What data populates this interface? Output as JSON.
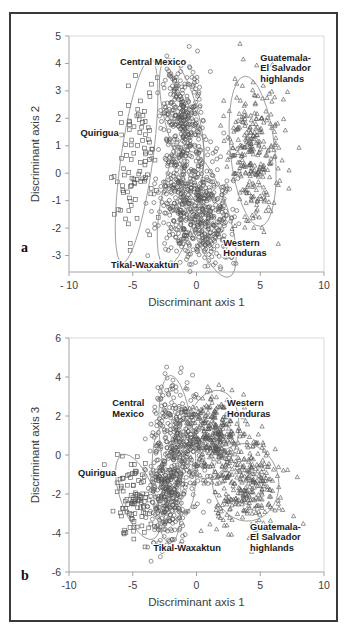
{
  "figure": {
    "panels": [
      {
        "id": "a",
        "letter": "a",
        "xlabel": "Discriminant axis 1",
        "ylabel": "Discriminant axis 2",
        "xticks": [
          "- 10",
          "-5",
          "0",
          "5",
          "10"
        ],
        "xtickvalues": [
          -10,
          -5,
          0,
          5,
          10
        ],
        "yticks": [
          "5",
          "4",
          "3",
          "2",
          "1",
          "0",
          "-1",
          "-2",
          "-3"
        ],
        "ytickvalues": [
          5,
          4,
          3,
          2,
          1,
          0,
          -1,
          -2,
          -3
        ],
        "xlim": [
          -10,
          10
        ],
        "ylim": [
          -3.6,
          5
        ],
        "grid": false,
        "labels": [
          {
            "name": "central-mexico",
            "text": "Central Mexico",
            "lines": [
              "Central Mexico"
            ],
            "x": -6.0,
            "y": 3.95
          },
          {
            "name": "guatemala-el-salvador-highlands",
            "text": "Guatemala-El Salvador highlands",
            "lines": [
              "Guatemala-",
              "El Salvador",
              "highlands"
            ],
            "x": 5.0,
            "y": 4.1
          },
          {
            "name": "quirigua",
            "text": "Quirigua",
            "lines": [
              "Quirigua"
            ],
            "x": -9.1,
            "y": 1.35
          },
          {
            "name": "western-honduras",
            "text": "Western Honduras",
            "lines": [
              "Western",
              "Honduras"
            ],
            "x": 2.1,
            "y": -2.65
          },
          {
            "name": "tikal-waxaktun",
            "text": "Tikal-Waxaktun",
            "lines": [
              "Tikal-Waxaktun"
            ],
            "x": -6.7,
            "y": -3.45
          }
        ]
      },
      {
        "id": "b",
        "letter": "b",
        "xlabel": "Discriminant axis 1",
        "ylabel": "Discriminant axis 3",
        "xticks": [
          "-10",
          "-5",
          "0",
          "5",
          "10"
        ],
        "xtickvalues": [
          -10,
          -5,
          0,
          5,
          10
        ],
        "yticks": [
          "6",
          "4",
          "2",
          "0",
          "-2",
          "-4",
          "-6"
        ],
        "ytickvalues": [
          6,
          4,
          2,
          0,
          -2,
          -4,
          -6
        ],
        "xlim": [
          -10,
          10
        ],
        "ylim": [
          -6,
          6
        ],
        "grid": false,
        "labels": [
          {
            "name": "central-mexico",
            "text": "Central Mexico",
            "lines": [
              "Central",
              "Mexico"
            ],
            "x": -6.6,
            "y": 2.5
          },
          {
            "name": "western-honduras",
            "text": "Western Honduras",
            "lines": [
              "Western",
              "Honduras"
            ],
            "x": 2.4,
            "y": 2.5
          },
          {
            "name": "quirigua",
            "text": "Quirigua",
            "lines": [
              "Quirigua"
            ],
            "x": -9.3,
            "y": -1.1
          },
          {
            "name": "tikal-waxaktun",
            "text": "Tikal-Waxaktun",
            "lines": [
              "Tikal-Waxaktun"
            ],
            "x": -3.4,
            "y": -4.9
          },
          {
            "name": "guatemala-el-salvador-highlands",
            "text": "Guatemala-El Salvador highlands",
            "lines": [
              "Guatemala-",
              "El Salvador",
              "highlands"
            ],
            "x": 4.2,
            "y": -3.85
          }
        ]
      }
    ]
  },
  "chart_data": [
    {
      "type": "scatter",
      "panel": "a",
      "title": "",
      "xlabel": "Discriminant axis 1",
      "ylabel": "Discriminant axis 2",
      "xlim": [
        -10,
        10
      ],
      "ylim": [
        -3.6,
        5
      ],
      "xticks": [
        -10,
        -5,
        0,
        5,
        10
      ],
      "yticks": [
        5,
        4,
        3,
        2,
        1,
        0,
        -1,
        -2,
        -3
      ],
      "grid": false,
      "legend": "in-plot group labels",
      "color": "#555555",
      "series": [
        {
          "name": "Quirigua",
          "marker": "square",
          "n": 95,
          "center": [
            -4.8,
            0.45
          ],
          "spread": [
            0.85,
            1.55
          ],
          "angle": -12,
          "ellipse": {
            "cx": -4.7,
            "cy": 0.45,
            "rx": 1.25,
            "ry": 3.75,
            "rotation": -8
          }
        },
        {
          "name": "Central Mexico",
          "marker": "circle",
          "n": 300,
          "center": [
            -1.1,
            2.05
          ],
          "spread": [
            0.78,
            1.0
          ],
          "angle": 20,
          "ellipse": {
            "cx": -1.15,
            "cy": 2.0,
            "rx": 1.35,
            "ry": 2.25,
            "rotation": 14
          }
        },
        {
          "name": "Tikal-Waxaktun",
          "marker": "circle",
          "n": 300,
          "center": [
            -1.15,
            -0.85
          ],
          "spread": [
            0.95,
            1.2
          ],
          "angle": -20,
          "ellipse": {
            "cx": -1.25,
            "cy": -0.85,
            "rx": 1.45,
            "ry": 2.6,
            "rotation": -12
          }
        },
        {
          "name": "Western Honduras",
          "marker": "circle",
          "n": 320,
          "center": [
            1.0,
            -1.75
          ],
          "spread": [
            1.0,
            1.05
          ],
          "angle": 25,
          "ellipse": {
            "cx": 0.95,
            "cy": -1.5,
            "rx": 1.55,
            "ry": 2.4,
            "rotation": 18
          }
        },
        {
          "name": "Guatemala-El Salvador highlands",
          "marker": "triangle",
          "n": 290,
          "center": [
            4.4,
            0.85
          ],
          "spread": [
            1.1,
            1.3
          ],
          "angle": 8,
          "ellipse": {
            "cx": 4.4,
            "cy": 0.8,
            "rx": 1.75,
            "ry": 2.75,
            "rotation": 6
          }
        }
      ]
    },
    {
      "type": "scatter",
      "panel": "b",
      "title": "",
      "xlabel": "Discriminant axis 1",
      "ylabel": "Discriminant axis 3",
      "xlim": [
        -10,
        10
      ],
      "ylim": [
        -6,
        6
      ],
      "xticks": [
        -10,
        -5,
        0,
        5,
        10
      ],
      "yticks": [
        6,
        4,
        2,
        0,
        -2,
        -4,
        -6
      ],
      "grid": false,
      "legend": "in-plot group labels",
      "color": "#555555",
      "series": [
        {
          "name": "Quirigua",
          "marker": "square",
          "n": 95,
          "center": [
            -4.9,
            -2.2
          ],
          "spread": [
            0.85,
            1.0
          ],
          "angle": 15,
          "ellipse": {
            "cx": -4.6,
            "cy": -2.15,
            "rx": 1.35,
            "ry": 2.3,
            "rotation": 20
          }
        },
        {
          "name": "Central Mexico",
          "marker": "circle",
          "n": 300,
          "center": [
            -1.45,
            0.75
          ],
          "spread": [
            0.9,
            1.6
          ],
          "angle": 10,
          "ellipse": {
            "cx": -1.5,
            "cy": 0.55,
            "rx": 1.35,
            "ry": 3.55,
            "rotation": 6
          }
        },
        {
          "name": "Tikal-Waxaktun",
          "marker": "circle",
          "n": 300,
          "center": [
            -2.3,
            -1.9
          ],
          "spread": [
            0.75,
            1.4
          ],
          "angle": 6,
          "ellipse": {
            "cx": -2.35,
            "cy": -1.55,
            "rx": 1.1,
            "ry": 3.0,
            "rotation": 4
          }
        },
        {
          "name": "Western Honduras",
          "marker": "triangle",
          "n": 330,
          "center": [
            1.2,
            1.1
          ],
          "spread": [
            1.15,
            1.0
          ],
          "angle": -15,
          "ellipse": {
            "cx": 1.15,
            "cy": 1.05,
            "rx": 2.1,
            "ry": 2.3,
            "rotation": -12
          }
        },
        {
          "name": "Guatemala-El Salvador highlands",
          "marker": "triangle",
          "n": 300,
          "center": [
            3.9,
            -1.6
          ],
          "spread": [
            1.45,
            1.1
          ],
          "angle": 8,
          "ellipse": {
            "cx": 3.85,
            "cy": -1.4,
            "rx": 2.6,
            "ry": 2.0,
            "rotation": 10
          }
        }
      ]
    }
  ]
}
